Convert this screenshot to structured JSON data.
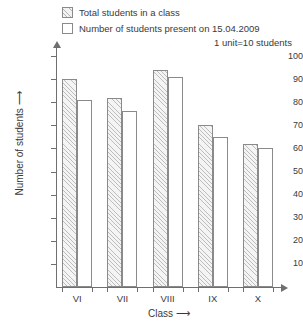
{
  "legend": {
    "items": [
      {
        "label": "Total students in a class",
        "swatch": "hatched"
      },
      {
        "label": "Number of students present on 15.04.2009",
        "swatch": "empty"
      }
    ],
    "unit_note": "1 unit=10 students"
  },
  "axes": {
    "y_title": "Number of students ⟶",
    "x_title": "Class ⟶",
    "y_ticks": [
      "100",
      "90",
      "80",
      "70",
      "60",
      "50",
      "40",
      "30",
      "20",
      "10"
    ]
  },
  "chart_data": {
    "type": "bar",
    "title": "",
    "xlabel": "Class ⟶",
    "ylabel": "Number of students ⟶",
    "categories": [
      "VI",
      "VII",
      "VIII",
      "IX",
      "X"
    ],
    "series": [
      {
        "name": "Total students in a class",
        "values": [
          90,
          82,
          94,
          70,
          62
        ]
      },
      {
        "name": "Number of students present on 15.04.2009",
        "values": [
          81,
          76,
          91,
          65,
          60
        ]
      }
    ],
    "ylim": [
      0,
      100
    ],
    "ytick_step": 10,
    "grid": false,
    "legend_position": "top",
    "annotation": "1 unit=10 students"
  },
  "colors": {
    "axis": "#6f6f6f",
    "bar_outline": "#8a8a8a",
    "hatch": "#bdbdbd",
    "text": "#3a3a3a",
    "background": "#ffffff"
  }
}
